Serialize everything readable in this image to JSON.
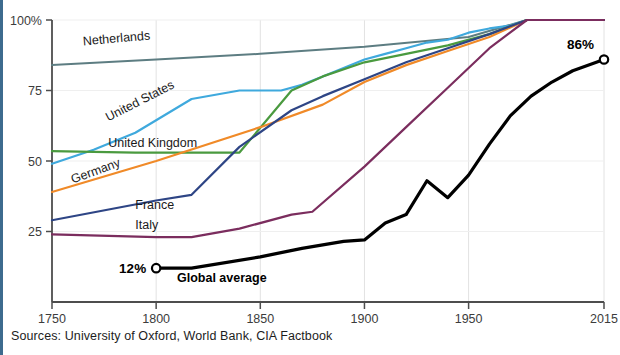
{
  "figure": {
    "source_note": "Sources: University of Oxford, World Bank, CIA Factbook",
    "accent_color": "#3d6b8e",
    "background_color": "#ffffff"
  },
  "chart_data": {
    "type": "line",
    "title": "",
    "subtitle": "",
    "xlabel": "",
    "ylabel": "",
    "xlim": [
      1750,
      2015
    ],
    "ylim": [
      0,
      100
    ],
    "xticks": [
      1750,
      1800,
      1850,
      1900,
      1950,
      2015
    ],
    "xtick_labels": [
      "1750",
      "1800",
      "1850",
      "1900",
      "1950",
      "2015"
    ],
    "yticks": [
      25,
      50,
      75,
      100
    ],
    "ytick_labels": [
      "25",
      "50",
      "75",
      "100%"
    ],
    "grid": "vertical-and-horizontal-light",
    "legend_position": "inline-labels",
    "annotations": [
      {
        "name": "global-average-start",
        "text": "12%",
        "x": 1800,
        "y": 12,
        "marker": "open-circle"
      },
      {
        "name": "global-average-end",
        "text": "86%",
        "x": 2015,
        "y": 86,
        "marker": "open-circle"
      },
      {
        "name": "global-average-name",
        "text": "Global average",
        "x": 1810,
        "y": 7
      }
    ],
    "series": [
      {
        "name": "Netherlands",
        "label": "Netherlands",
        "color": "#5d7d82",
        "width": 2.0,
        "label_x": 1765,
        "label_y": 91,
        "label_rotate": -5,
        "x": [
          1750,
          1800,
          1850,
          1900,
          1950,
          1978,
          2015
        ],
        "values": [
          84,
          86,
          88,
          90.5,
          94,
          100,
          100
        ]
      },
      {
        "name": "United States",
        "label": "United States",
        "color": "#3fa9dd",
        "width": 2.2,
        "label_x": 1777,
        "label_y": 64,
        "label_rotate": -27,
        "x": [
          1750,
          1770,
          1790,
          1817,
          1840,
          1860,
          1870,
          1880,
          1890,
          1900,
          1910,
          1920,
          1930,
          1940,
          1950,
          1960,
          1970,
          1978,
          2015
        ],
        "values": [
          49,
          54,
          60,
          72,
          75,
          75,
          77,
          80,
          83,
          86,
          88,
          90,
          92,
          93,
          95.5,
          97,
          98,
          100,
          100
        ]
      },
      {
        "name": "United Kingdom",
        "label": "United Kingdom",
        "color": "#4a9a3f",
        "width": 2.2,
        "label_x": 1777,
        "label_y": 55,
        "label_rotate": 0,
        "x": [
          1750,
          1790,
          1820,
          1840,
          1865,
          1880,
          1900,
          1920,
          1940,
          1960,
          1978,
          2015
        ],
        "values": [
          53.5,
          53,
          53,
          53,
          75,
          80,
          85,
          88,
          91,
          95,
          100,
          100
        ]
      },
      {
        "name": "Germany",
        "label": "Germany",
        "color": "#f08a28",
        "width": 2.2,
        "label_x": 1760,
        "label_y": 42,
        "label_rotate": -20,
        "x": [
          1750,
          1800,
          1850,
          1880,
          1900,
          1920,
          1940,
          1960,
          1978,
          2015
        ],
        "values": [
          39,
          50,
          62,
          70,
          78,
          84,
          89,
          94,
          100,
          100
        ]
      },
      {
        "name": "France",
        "label": "France",
        "color": "#2e4585",
        "width": 2.2,
        "label_x": 1790,
        "label_y": 33,
        "label_rotate": 0,
        "x": [
          1750,
          1800,
          1817,
          1840,
          1865,
          1880,
          1900,
          1920,
          1940,
          1960,
          1978,
          2015
        ],
        "values": [
          29,
          36,
          38,
          55,
          68,
          73,
          79,
          85,
          90,
          95,
          100,
          100
        ]
      },
      {
        "name": "Italy",
        "label": "Italy",
        "color": "#7b2d5e",
        "width": 2.2,
        "label_x": 1790,
        "label_y": 26,
        "label_rotate": 0,
        "x": [
          1750,
          1800,
          1817,
          1840,
          1865,
          1875,
          1900,
          1920,
          1940,
          1960,
          1978,
          2015
        ],
        "values": [
          24,
          23,
          23,
          26,
          31,
          32,
          48,
          62,
          76,
          90,
          100,
          100
        ]
      },
      {
        "name": "Global average",
        "label": "Global average",
        "color": "#000000",
        "width": 3.2,
        "label_x": 1812,
        "label_y": 7,
        "label_rotate": 0,
        "x": [
          1800,
          1817,
          1850,
          1870,
          1890,
          1900,
          1910,
          1920,
          1930,
          1940,
          1950,
          1960,
          1970,
          1980,
          1990,
          2000,
          2015
        ],
        "values": [
          12,
          12,
          16,
          19,
          21.5,
          22,
          28,
          31,
          43,
          37,
          45,
          56,
          66,
          73,
          78,
          82,
          86
        ]
      }
    ]
  }
}
